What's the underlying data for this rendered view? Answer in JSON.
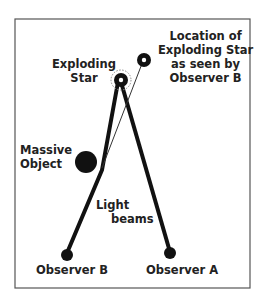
{
  "labels": {
    "exploding_star": [
      "Exploding",
      "Star"
    ],
    "apparent_location": [
      "Location of",
      "Exploding Star",
      "as seen by",
      "Observer B"
    ],
    "massive_object": [
      "Massive",
      "Object"
    ],
    "light_beams": [
      "Light",
      "beams"
    ],
    "observer_b": "Observer B",
    "observer_a": "Observer A"
  },
  "colors": {
    "line": "#111111",
    "border": "#555555",
    "background": "#ffffff"
  }
}
